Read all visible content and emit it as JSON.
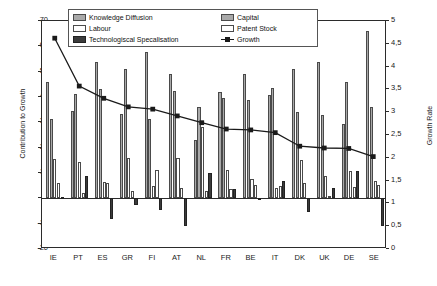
{
  "chart_data": {
    "type": "bar",
    "title": "",
    "xlabel": "",
    "ylabel": "Contribution to Growth",
    "y2label": "Growth Rate",
    "ylim": [
      -20,
      70
    ],
    "y2lim": [
      0,
      5
    ],
    "yticks": [
      "70",
      "60",
      "50",
      "40",
      "30",
      "20",
      "10",
      "0",
      "-10",
      "-20"
    ],
    "y2ticks": [
      "5",
      "4,5",
      "4",
      "3,5",
      "3",
      "2,5",
      "2",
      "1,5",
      "1",
      "0,5",
      "0"
    ],
    "grid": false,
    "legend_position": "top-center",
    "categories": [
      "IE",
      "PT",
      "ES",
      "GR",
      "FI",
      "AT",
      "NL",
      "FR",
      "BE",
      "IT",
      "DK",
      "UK",
      "DE",
      "SE"
    ],
    "series": [
      {
        "name": "Knowledge Diffusion",
        "axis": "left",
        "color": "#a9a9a9",
        "values": [
          46.0,
          34.3,
          53.8,
          33.2,
          57.7,
          49.1,
          23.2,
          41.8,
          49.1,
          40.6,
          51.0,
          54.0,
          29.5,
          66.0
        ]
      },
      {
        "name": "Capital",
        "axis": "left",
        "color": "#a9a9a9",
        "values": [
          31.3,
          41.0,
          43.0,
          51.0,
          31.4,
          42.3,
          36.0,
          39.8,
          39.0,
          43.7,
          34.0,
          33.0,
          46.0,
          35.9
        ]
      },
      {
        "name": "Labour",
        "axis": "left",
        "color": "#ffffff",
        "values": [
          15.7,
          14.2,
          6.4,
          15.8,
          5.0,
          15.8,
          28.0,
          11.0,
          7.5,
          4.2,
          15.0,
          8.8,
          10.8,
          6.8
        ]
      },
      {
        "name": "Patent Stock",
        "axis": "left",
        "color": "#ffffff",
        "values": [
          6.1,
          2.2,
          5.9,
          3.0,
          11.2,
          4.2,
          3.0,
          3.8,
          5.4,
          4.8,
          6.2,
          0.8,
          4.5,
          5.2
        ]
      },
      {
        "name": "Technologiscal Specalisation",
        "axis": "left",
        "color": "#3b3b3b",
        "values": [
          0.6,
          8.9,
          -8.2,
          -2.6,
          -4.5,
          -11.0,
          10.1,
          3.8,
          -0.3,
          6.8,
          -5.5,
          4.2,
          10.9,
          -11.1
        ]
      },
      {
        "name": "Growth",
        "axis": "right",
        "color": "#1a1a1a",
        "type": "line",
        "values": [
          4.62,
          3.56,
          3.29,
          3.1,
          3.05,
          2.9,
          2.75,
          2.61,
          2.59,
          2.53,
          2.23,
          2.19,
          2.18,
          2.0
        ]
      }
    ]
  },
  "legend": {
    "items": [
      {
        "label": "Knowledge Diffusion",
        "swatch": "swatch-knowledge-diffusion"
      },
      {
        "label": "Capital",
        "swatch": "swatch-capital"
      },
      {
        "label": "Labour",
        "swatch": "swatch-labour"
      },
      {
        "label": "Patent Stock",
        "swatch": "swatch-patent-stock"
      },
      {
        "label": "Technologiscal Specalisation",
        "swatch": "swatch-technological-specialisation"
      },
      {
        "label": "Growth",
        "swatch": "swatch-growth-line"
      }
    ]
  },
  "colors": {
    "bar_light": "#a9a9a9",
    "bar_white": "#ffffff",
    "bar_dark": "#3b3b3b",
    "line": "#1a1a1a",
    "axis": "#2b2b2b"
  }
}
